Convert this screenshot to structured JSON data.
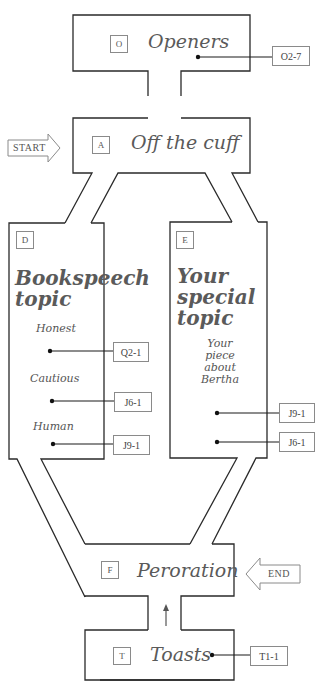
{
  "nodes": {
    "openers": {
      "letter": "O",
      "title": "Openers",
      "refs": [
        "O2-7"
      ]
    },
    "off_the_cuff": {
      "letter": "A",
      "title": "Off the cuff"
    },
    "bookspeech": {
      "letter": "D",
      "title": "Bookspeech topic",
      "items": [
        {
          "label": "Honest",
          "ref": "Q2-1"
        },
        {
          "label": "Cautious",
          "ref": "J6-1"
        },
        {
          "label": "Human",
          "ref": "J9-1"
        }
      ]
    },
    "special_topic": {
      "letter": "E",
      "title": "Your special topic",
      "note": "Your piece about Bertha",
      "refs": [
        "J9-1",
        "J6-1"
      ]
    },
    "peroration": {
      "letter": "F",
      "title": "Peroration"
    },
    "toasts": {
      "letter": "T",
      "title": "Toasts",
      "refs": [
        "T1-1"
      ]
    }
  },
  "markers": {
    "start": "START",
    "end": "END"
  },
  "icons": {
    "start": "right-arrow-icon",
    "end": "left-arrow-icon",
    "flow": "up-arrow-icon"
  },
  "colors": {
    "line": "#2a2a2a",
    "text": "#5a5a5a",
    "box": "#8a8a8a"
  }
}
